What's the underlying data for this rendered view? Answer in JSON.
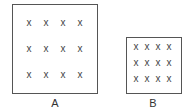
{
  "diagram": {
    "boxes": [
      {
        "id": "A",
        "label": "A",
        "rows": 3,
        "cols": 4,
        "mark": "x"
      },
      {
        "id": "B",
        "label": "B",
        "rows": 3,
        "cols": 4,
        "mark": "x"
      }
    ]
  }
}
